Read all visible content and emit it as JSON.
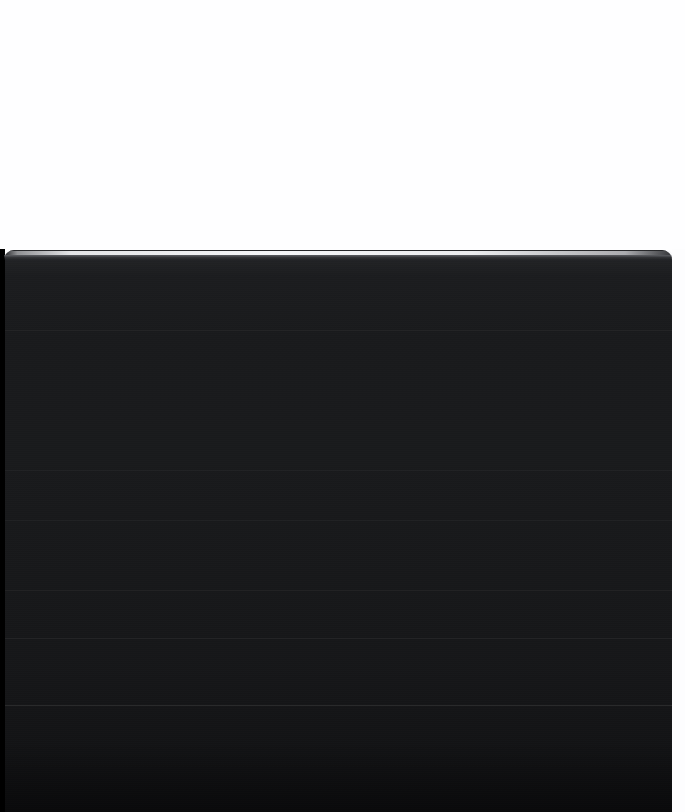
{
  "screen": {
    "width": 685,
    "height": 812,
    "background_color": "#ffffff",
    "description": "Dark overlay sheet rising over a blank white page"
  },
  "backdrop": {
    "name": "page-backdrop",
    "color": "#fefeff",
    "content": ""
  },
  "sheet": {
    "name": "dark-sheet-panel",
    "background_color": "#191a1c",
    "top_edge_color": "#f8f9fb",
    "left": 4,
    "top": 250,
    "width": 668,
    "height": 562,
    "corner_radius": 10,
    "title": "",
    "body_text": ""
  },
  "gutter": {
    "left_strip_color": "#000000",
    "right_margin_color": "#fdfdfe"
  },
  "dividers": [
    {
      "id": "divider-1",
      "y": 80,
      "color": "rgba(255,255,255,0.035)"
    },
    {
      "id": "divider-2",
      "y": 220,
      "color": "rgba(255,255,255,0.030)"
    },
    {
      "id": "divider-3",
      "y": 270,
      "color": "rgba(255,255,255,0.032)"
    },
    {
      "id": "divider-4",
      "y": 340,
      "color": "rgba(255,255,255,0.038)"
    },
    {
      "id": "divider-5",
      "y": 388,
      "color": "rgba(255,255,255,0.050)"
    },
    {
      "id": "divider-6",
      "y": 455,
      "color": "rgba(255,255,255,0.090)"
    }
  ],
  "rows": [
    {
      "id": "row-1",
      "label": "",
      "top": 6,
      "height": 74
    },
    {
      "id": "row-2",
      "label": "",
      "top": 81,
      "height": 139
    },
    {
      "id": "row-3",
      "label": "",
      "top": 221,
      "height": 49
    },
    {
      "id": "row-4",
      "label": "",
      "top": 271,
      "height": 69
    },
    {
      "id": "row-5",
      "label": "",
      "top": 341,
      "height": 47
    },
    {
      "id": "row-6",
      "label": "",
      "top": 389,
      "height": 66
    },
    {
      "id": "row-7",
      "label": "",
      "top": 456,
      "height": 106
    }
  ]
}
